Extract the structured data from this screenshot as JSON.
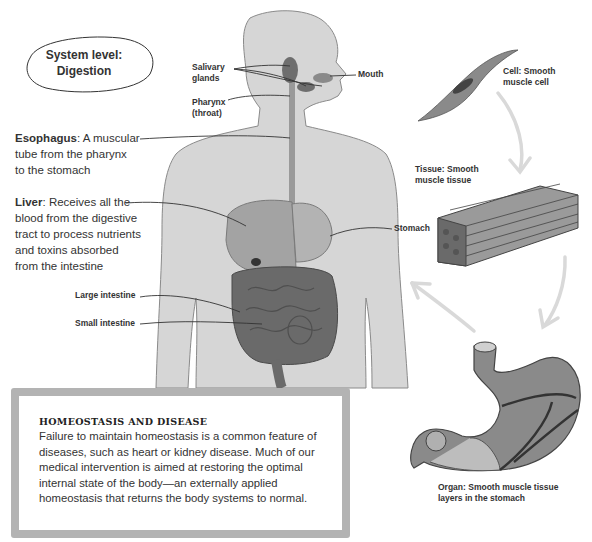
{
  "system_label": {
    "line1": "System level:",
    "line2": "Digestion"
  },
  "body_labels": {
    "salivary": {
      "line1": "Salivary",
      "line2": "glands"
    },
    "pharynx": {
      "line1": "Pharynx",
      "line2": "(throat)"
    },
    "mouth": "Mouth",
    "stomach": "Stomach",
    "large_intestine": "Large intestine",
    "small_intestine": "Small intestine"
  },
  "descriptions": {
    "esophagus": {
      "term": "Esophagus",
      "text_lines": [
        ": A muscular",
        "tube from the pharynx",
        "to the stomach"
      ]
    },
    "liver": {
      "term": "Liver",
      "text_lines": [
        ": Receives all the",
        "blood from the digestive",
        "tract to process nutrients",
        "and toxins absorbed",
        "from the intestine"
      ]
    }
  },
  "hierarchy": {
    "cell": {
      "line1": "Cell: Smooth",
      "line2": "muscle cell"
    },
    "tissue": {
      "line1": "Tissue: Smooth",
      "line2": "muscle tissue"
    },
    "organ": {
      "line1": "Organ: Smooth muscle tissue",
      "line2": "layers in the stomach"
    }
  },
  "infobox": {
    "title": "HOMEOSTASIS AND DISEASE",
    "body": "Failure to maintain homeostasis is a common feature of diseases, such as heart or kidney disease. Much of our medical intervention is aimed at restoring the optimal internal state of the body—an externally applied homeostasis that returns the body systems to normal."
  },
  "colors": {
    "body_fill": "#d6d6d6",
    "organ_dark": "#6e6e6e",
    "organ_mid": "#9a9a9a",
    "arrow": "#d9d9d9",
    "box_border": "#b3b3b3"
  }
}
